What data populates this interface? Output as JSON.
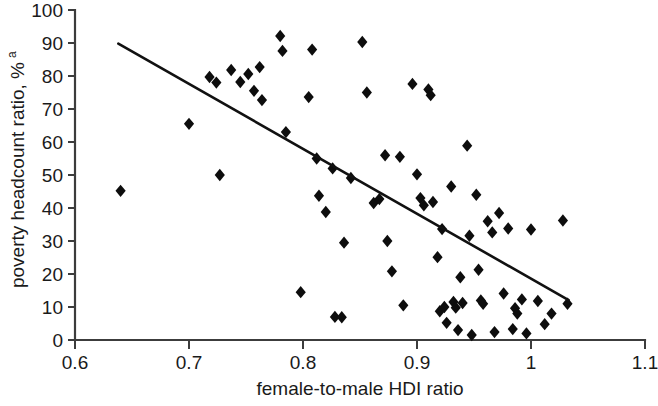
{
  "chart_data": {
    "type": "scatter",
    "title": "",
    "xlabel": "female-to-male HDI ratio",
    "ylabel": "poverty headcount ratio, %",
    "ylabel_superscript": "a",
    "xlim": [
      0.6,
      1.1
    ],
    "ylim": [
      0,
      100
    ],
    "xticks": [
      0.6,
      0.7,
      0.8,
      0.9,
      1.0,
      1.1
    ],
    "xtick_labels": [
      "0.6",
      "0.7",
      "0.8",
      "0.9",
      "1",
      "1.1"
    ],
    "yticks": [
      0,
      10,
      20,
      30,
      40,
      50,
      60,
      70,
      80,
      90,
      100
    ],
    "ytick_labels": [
      "0",
      "10",
      "20",
      "30",
      "40",
      "50",
      "60",
      "70",
      "80",
      "90",
      "100"
    ],
    "grid": false,
    "legend": null,
    "marker": "diamond",
    "marker_color": "#0d0d0d",
    "series": [
      {
        "name": "countries",
        "points": [
          [
            0.64,
            45.2
          ],
          [
            0.7,
            65.5
          ],
          [
            0.718,
            79.7
          ],
          [
            0.724,
            78.0
          ],
          [
            0.727,
            50.0
          ],
          [
            0.737,
            81.8
          ],
          [
            0.745,
            78.2
          ],
          [
            0.752,
            80.6
          ],
          [
            0.757,
            75.5
          ],
          [
            0.762,
            82.7
          ],
          [
            0.764,
            72.7
          ],
          [
            0.78,
            92.1
          ],
          [
            0.782,
            87.6
          ],
          [
            0.785,
            63.0
          ],
          [
            0.798,
            14.5
          ],
          [
            0.805,
            73.6
          ],
          [
            0.808,
            88.0
          ],
          [
            0.812,
            55.0
          ],
          [
            0.814,
            43.7
          ],
          [
            0.82,
            38.8
          ],
          [
            0.826,
            52.0
          ],
          [
            0.828,
            7.0
          ],
          [
            0.834,
            6.9
          ],
          [
            0.836,
            29.5
          ],
          [
            0.842,
            49.1
          ],
          [
            0.852,
            90.3
          ],
          [
            0.856,
            75.0
          ],
          [
            0.862,
            41.5
          ],
          [
            0.867,
            42.7
          ],
          [
            0.872,
            56.0
          ],
          [
            0.874,
            30.0
          ],
          [
            0.878,
            20.8
          ],
          [
            0.885,
            55.5
          ],
          [
            0.888,
            10.5
          ],
          [
            0.896,
            77.6
          ],
          [
            0.9,
            50.2
          ],
          [
            0.903,
            43.0
          ],
          [
            0.906,
            40.8
          ],
          [
            0.91,
            75.9
          ],
          [
            0.912,
            74.2
          ],
          [
            0.914,
            41.8
          ],
          [
            0.918,
            25.1
          ],
          [
            0.92,
            8.7
          ],
          [
            0.922,
            33.6
          ],
          [
            0.924,
            10.0
          ],
          [
            0.926,
            5.2
          ],
          [
            0.93,
            46.5
          ],
          [
            0.932,
            11.5
          ],
          [
            0.934,
            9.8
          ],
          [
            0.936,
            3.0
          ],
          [
            0.938,
            19.0
          ],
          [
            0.94,
            11.2
          ],
          [
            0.944,
            58.9
          ],
          [
            0.946,
            31.6
          ],
          [
            0.948,
            1.5
          ],
          [
            0.952,
            44.0
          ],
          [
            0.954,
            21.3
          ],
          [
            0.956,
            12.0
          ],
          [
            0.958,
            11.0
          ],
          [
            0.962,
            36.0
          ],
          [
            0.966,
            32.6
          ],
          [
            0.968,
            2.4
          ],
          [
            0.972,
            38.5
          ],
          [
            0.976,
            14.1
          ],
          [
            0.98,
            33.8
          ],
          [
            0.984,
            3.3
          ],
          [
            0.986,
            9.6
          ],
          [
            0.988,
            8.0
          ],
          [
            0.992,
            12.3
          ],
          [
            0.996,
            2.0
          ],
          [
            1.0,
            33.5
          ],
          [
            1.006,
            11.8
          ],
          [
            1.012,
            4.8
          ],
          [
            1.018,
            8.0
          ],
          [
            1.028,
            36.2
          ],
          [
            1.032,
            11.0
          ]
        ]
      }
    ],
    "trendline": {
      "x_start": 0.638,
      "y_start": 89.8,
      "x_end": 1.033,
      "y_end": 12.1,
      "type": "linear-fit"
    }
  }
}
